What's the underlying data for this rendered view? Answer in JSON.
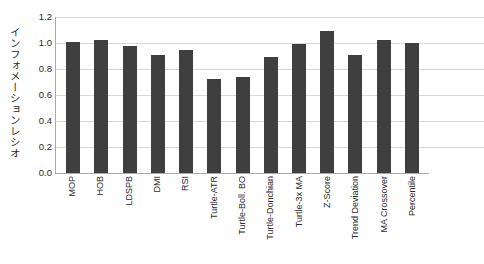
{
  "chart_data": {
    "type": "bar",
    "title": "",
    "subtitle": "",
    "xlabel": "",
    "ylabel": "インフォメーションレシオ",
    "ylim": [
      0.0,
      1.2
    ],
    "yticks": [
      "0.0",
      "0.2",
      "0.4",
      "0.6",
      "0.8",
      "1.0",
      "1.2"
    ],
    "ytick_values": [
      0.0,
      0.2,
      0.4,
      0.6,
      0.8,
      1.0,
      1.2
    ],
    "grid": true,
    "legend": false,
    "legend_position": "none",
    "bar_color": "#3f3f3f",
    "gridline_color": "#d8d8d8",
    "axis_color": "#aaaaaa",
    "categories": [
      "MOP",
      "HOB",
      "LDSPB",
      "DMI",
      "RSI",
      "Turtle-ATR",
      "Turtle-Boll. BO",
      "Turtle-Donchian",
      "Turtle-3x MA",
      "Z-Score",
      "Trend Deviation",
      "MA Crossover",
      "Percentile"
    ],
    "values": [
      1.01,
      1.02,
      0.98,
      0.91,
      0.95,
      0.72,
      0.74,
      0.89,
      0.99,
      1.09,
      0.91,
      1.02,
      1.0
    ]
  }
}
